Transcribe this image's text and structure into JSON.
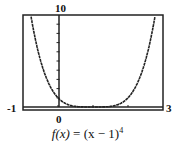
{
  "chart_data": {
    "type": "line",
    "function": "(x-1)^4",
    "xlim": [
      -1,
      3
    ],
    "ylim": [
      0,
      10
    ],
    "x_tick_labels": {
      "left": "-1",
      "origin": "0",
      "right": "3"
    },
    "y_tick_labels": {
      "top": "10"
    },
    "x_ticks": [
      0,
      1,
      2
    ],
    "y_ticks": [
      1,
      2,
      3,
      4,
      5,
      6,
      7,
      8,
      9
    ],
    "x": [
      -0.78,
      -0.5,
      0,
      0.5,
      1,
      1.5,
      2,
      2.5,
      2.78
    ],
    "y": [
      10.0,
      5.06,
      1,
      0.0625,
      0,
      0.0625,
      1,
      5.06,
      10.0
    ],
    "grid": false,
    "legend": null
  },
  "labels": {
    "ymax": "10",
    "xmin": "-1",
    "xmax": "3",
    "origin": "0",
    "fx": "f(x)",
    "eq": " = (x − 1)",
    "exp": "4"
  }
}
